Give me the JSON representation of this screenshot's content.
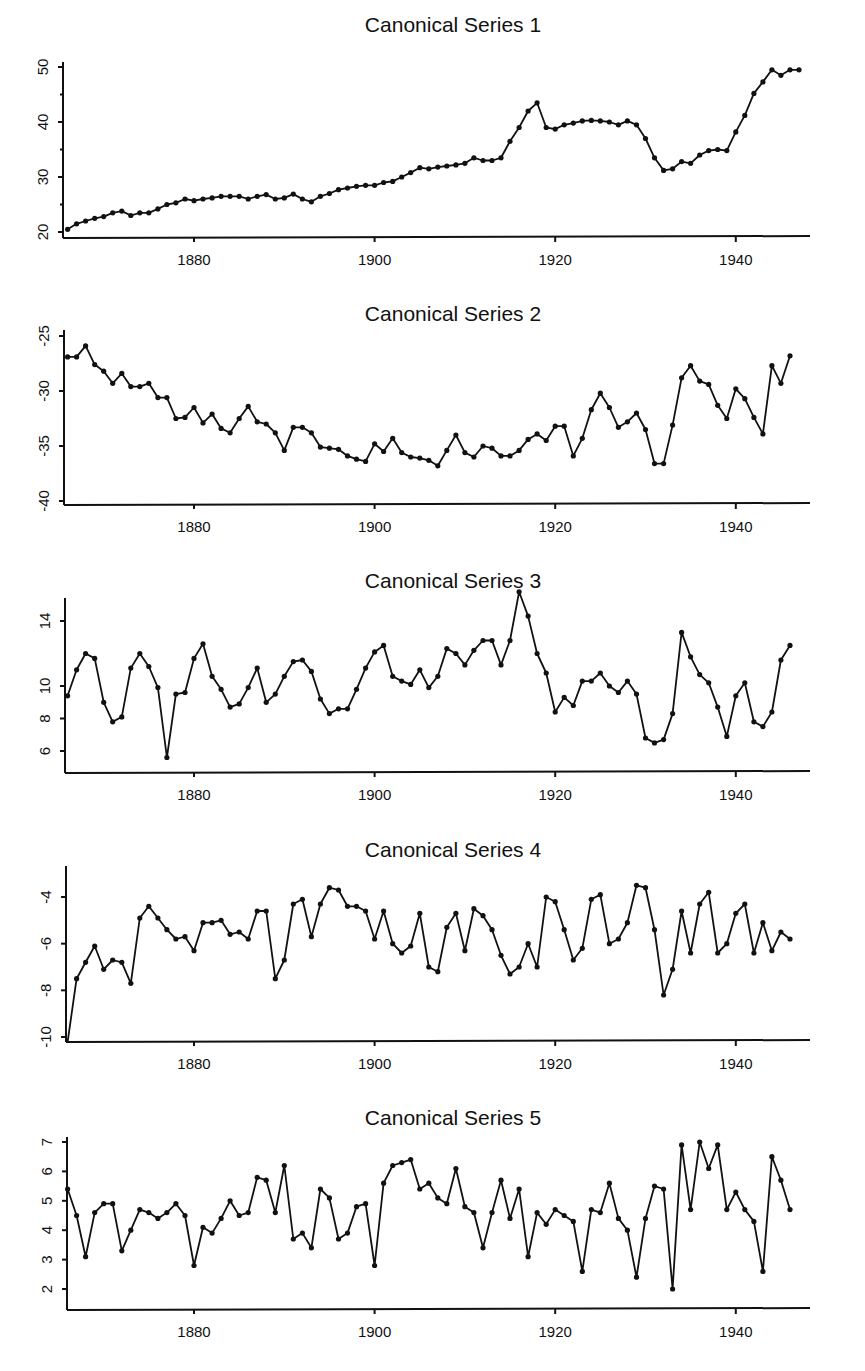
{
  "figure": {
    "panels": [
      {
        "title": "Canonical Series 1"
      },
      {
        "title": "Canonical Series 2"
      },
      {
        "title": "Canonical Series 3"
      },
      {
        "title": "Canonical Series 4"
      },
      {
        "title": "Canonical Series 5"
      }
    ]
  },
  "chart_data": [
    {
      "type": "line",
      "title": "Canonical Series 1",
      "xlabel": "",
      "ylabel": "",
      "x_start": 1866,
      "x_end": 1947,
      "xticks": [
        1880,
        1900,
        1920,
        1940
      ],
      "yticks": [
        20,
        30,
        40,
        50
      ],
      "ylim": [
        19,
        51
      ],
      "grid": false,
      "markers": true,
      "values": [
        20.5,
        21.5,
        22,
        22.5,
        22.8,
        23.5,
        23.8,
        23,
        23.5,
        23.5,
        24.2,
        25,
        25.3,
        26,
        25.7,
        26,
        26.2,
        26.5,
        26.5,
        26.5,
        26,
        26.5,
        26.8,
        26,
        26.2,
        26.9,
        26,
        25.5,
        26.5,
        27,
        27.7,
        28,
        28.3,
        28.5,
        28.5,
        29,
        29.2,
        30,
        30.8,
        31.7,
        31.5,
        31.8,
        32,
        32.2,
        32.5,
        33.5,
        33,
        33,
        33.5,
        36.5,
        39,
        42,
        43.5,
        39,
        38.7,
        39.5,
        39.8,
        40.2,
        40.3,
        40.2,
        40,
        39.5,
        40.2,
        39.5,
        37,
        33.5,
        31.2,
        31.5,
        32.8,
        32.5,
        34,
        34.8,
        35,
        34.8,
        38.2,
        41.2,
        45.2,
        47.3,
        49.5,
        48.5,
        49.5,
        49.5
      ]
    },
    {
      "type": "line",
      "title": "Canonical Series 2",
      "xlabel": "",
      "ylabel": "",
      "x_start": 1866,
      "x_end": 1947,
      "xticks": [
        1880,
        1900,
        1920,
        1940
      ],
      "yticks": [
        -25,
        -30,
        -35,
        -40
      ],
      "ylim": [
        -40.5,
        -24.5
      ],
      "grid": false,
      "markers": true,
      "values": [
        -26.9,
        -26.9,
        -25.9,
        -27.6,
        -28.2,
        -29.3,
        -28.4,
        -29.6,
        -29.6,
        -29.3,
        -30.6,
        -30.6,
        -32.5,
        -32.4,
        -31.5,
        -32.9,
        -32.1,
        -33.4,
        -33.8,
        -32.5,
        -31.4,
        -32.8,
        -33.0,
        -33.8,
        -35.4,
        -33.3,
        -33.3,
        -33.8,
        -35.1,
        -35.2,
        -35.3,
        -35.9,
        -36.2,
        -36.4,
        -34.8,
        -35.5,
        -34.3,
        -35.6,
        -36.0,
        -36.1,
        -36.3,
        -36.8,
        -35.4,
        -34.0,
        -35.6,
        -36.0,
        -35.0,
        -35.2,
        -35.9,
        -35.9,
        -35.4,
        -34.4,
        -33.9,
        -34.5,
        -33.2,
        -33.2,
        -35.9,
        -34.3,
        -31.7,
        -30.2,
        -31.5,
        -33.3,
        -32.8,
        -32.0,
        -33.5,
        -36.6,
        -36.6,
        -33.1,
        -28.8,
        -27.7,
        -29.1,
        -29.4,
        -31.3,
        -32.5,
        -29.8,
        -30.7,
        -32.4,
        -33.9,
        -27.7,
        -29.3,
        -26.8
      ]
    },
    {
      "type": "line",
      "title": "Canonical Series 3",
      "xlabel": "",
      "ylabel": "",
      "x_start": 1866,
      "x_end": 1947,
      "xticks": [
        1880,
        1900,
        1920,
        1940
      ],
      "yticks": [
        6,
        8,
        10,
        14
      ],
      "ylim": [
        4.5,
        16
      ],
      "grid": false,
      "markers": true,
      "values": [
        9.4,
        11.0,
        12.0,
        11.7,
        9.0,
        7.8,
        8.1,
        11.1,
        12.0,
        11.2,
        9.9,
        5.6,
        9.5,
        9.6,
        11.7,
        12.6,
        10.6,
        9.8,
        8.7,
        8.9,
        9.9,
        11.1,
        9.0,
        9.5,
        10.6,
        11.5,
        11.6,
        10.9,
        9.2,
        8.3,
        8.6,
        8.6,
        9.8,
        11.1,
        12.1,
        12.5,
        10.6,
        10.3,
        10.1,
        11.0,
        9.9,
        10.6,
        12.3,
        12.0,
        11.3,
        12.2,
        12.8,
        12.8,
        11.3,
        12.8,
        15.8,
        14.3,
        12.0,
        10.8,
        8.4,
        9.3,
        8.8,
        10.3,
        10.3,
        10.8,
        10.0,
        9.6,
        10.3,
        9.5,
        6.8,
        6.5,
        6.7,
        8.3,
        13.3,
        11.8,
        10.7,
        10.2,
        8.7,
        6.9,
        9.4,
        10.2,
        7.8,
        7.5,
        8.4,
        11.6,
        12.5
      ]
    },
    {
      "type": "line",
      "title": "Canonical Series 4",
      "xlabel": "",
      "ylabel": "",
      "x_start": 1866,
      "x_end": 1947,
      "xticks": [
        1880,
        1900,
        1920,
        1940
      ],
      "yticks": [
        -4,
        -6,
        -8,
        -10
      ],
      "ylim": [
        -10.2,
        -2.8
      ],
      "grid": false,
      "markers": true,
      "values": [
        -10.4,
        -7.5,
        -6.8,
        -6.1,
        -7.1,
        -6.7,
        -6.8,
        -7.7,
        -4.9,
        -4.4,
        -4.9,
        -5.4,
        -5.8,
        -5.7,
        -6.3,
        -5.1,
        -5.1,
        -5.0,
        -5.6,
        -5.5,
        -5.8,
        -4.6,
        -4.6,
        -7.5,
        -6.7,
        -4.3,
        -4.1,
        -5.7,
        -4.3,
        -3.6,
        -3.7,
        -4.4,
        -4.4,
        -4.6,
        -5.8,
        -4.6,
        -6.0,
        -6.4,
        -6.1,
        -4.7,
        -7.0,
        -7.2,
        -5.3,
        -4.7,
        -6.3,
        -4.5,
        -4.8,
        -5.4,
        -6.5,
        -7.3,
        -7.0,
        -6.0,
        -7.0,
        -4.0,
        -4.2,
        -5.4,
        -6.7,
        -6.2,
        -4.1,
        -3.9,
        -6.0,
        -5.8,
        -5.1,
        -3.5,
        -3.6,
        -5.4,
        -8.2,
        -7.1,
        -4.6,
        -6.4,
        -4.3,
        -3.8,
        -6.4,
        -6.0,
        -4.7,
        -4.3,
        -6.4,
        -5.1,
        -6.3,
        -5.5,
        -5.8
      ]
    },
    {
      "type": "line",
      "title": "Canonical Series 5",
      "xlabel": "",
      "ylabel": "",
      "x_start": 1866,
      "x_end": 1947,
      "xticks": [
        1880,
        1900,
        1920,
        1940
      ],
      "yticks": [
        2,
        3,
        4,
        5,
        6,
        7
      ],
      "ylim": [
        1.3,
        7.2
      ],
      "grid": false,
      "markers": true,
      "values": [
        5.4,
        4.5,
        3.1,
        4.6,
        4.9,
        4.9,
        3.3,
        4.0,
        4.7,
        4.6,
        4.4,
        4.6,
        4.9,
        4.5,
        2.8,
        4.1,
        3.9,
        4.4,
        5.0,
        4.5,
        4.6,
        5.8,
        5.7,
        4.6,
        6.2,
        3.7,
        3.9,
        3.4,
        5.4,
        5.1,
        3.7,
        3.9,
        4.8,
        4.9,
        2.8,
        5.6,
        6.2,
        6.3,
        6.4,
        5.4,
        5.6,
        5.1,
        4.9,
        6.1,
        4.8,
        4.6,
        3.4,
        4.6,
        5.7,
        4.4,
        5.4,
        3.1,
        4.6,
        4.2,
        4.7,
        4.5,
        4.3,
        2.6,
        4.7,
        4.6,
        5.6,
        4.4,
        4.0,
        2.4,
        4.4,
        5.5,
        5.4,
        2.0,
        6.9,
        4.7,
        7.0,
        6.1,
        6.9,
        4.7,
        5.3,
        4.7,
        4.3,
        2.6,
        6.5,
        5.7,
        4.7
      ]
    }
  ]
}
